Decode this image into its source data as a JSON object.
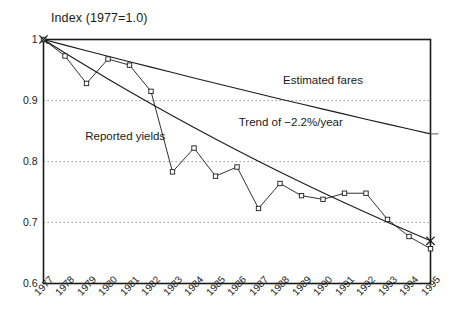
{
  "chart_data": {
    "type": "line",
    "title": "Index (1977=1.0)",
    "xlabel": "",
    "ylabel": "",
    "xlim": [
      1977,
      1995
    ],
    "ylim": [
      0.6,
      1.0
    ],
    "grid": true,
    "gridlines_y": [
      0.9,
      0.8,
      0.7
    ],
    "legend_position": "inline-annotations",
    "categories": [
      1977,
      1978,
      1979,
      1980,
      1981,
      1982,
      1983,
      1984,
      1985,
      1986,
      1987,
      1988,
      1989,
      1990,
      1991,
      1992,
      1993,
      1994,
      1995
    ],
    "xtick_labels": [
      "1977",
      "1978",
      "1979",
      "1980",
      "1981",
      "1982",
      "1983",
      "1984",
      "1985",
      "1986",
      "1987",
      "1988",
      "1989",
      "1990",
      "1991",
      "1992",
      "1993",
      "1994",
      "1995"
    ],
    "ytick_labels": [
      "1",
      "0.9",
      "0.8",
      "0.7",
      "0.6"
    ],
    "ytick_values": [
      1.0,
      0.9,
      0.8,
      0.7,
      0.6
    ],
    "series": [
      {
        "name": "Reported yields",
        "marker": "square",
        "values": [
          1.0,
          0.973,
          0.928,
          0.968,
          0.958,
          0.915,
          0.783,
          0.822,
          0.776,
          0.791,
          0.723,
          0.764,
          0.744,
          0.738,
          0.748,
          0.748,
          0.705,
          0.677,
          0.657
        ]
      },
      {
        "name": "Estimated fares",
        "marker": "none",
        "values": [
          1.0,
          0.9908,
          0.9817,
          0.9726,
          0.9636,
          0.9547,
          0.9458,
          0.937,
          0.9283,
          0.9197,
          0.9111,
          0.9026,
          0.8942,
          0.8859,
          0.8776,
          0.8694,
          0.8613,
          0.8533,
          0.8453
        ]
      },
      {
        "name": "Trend of −2.2%/year",
        "marker": "x-endpoint",
        "values": [
          1.0,
          0.978,
          0.9565,
          0.9354,
          0.9148,
          0.8947,
          0.875,
          0.8558,
          0.8369,
          0.8185,
          0.8005,
          0.7829,
          0.7657,
          0.7488,
          0.7323,
          0.7162,
          0.7005,
          0.6851,
          0.67
        ]
      }
    ],
    "annotations": [
      {
        "text": "Estimated fares",
        "x": 1990.0,
        "y": 0.93
      },
      {
        "text": "Trend of −2.2%/year",
        "x": 1988.5,
        "y": 0.862
      },
      {
        "text": "Reported yields",
        "x": 1980.8,
        "y": 0.838
      }
    ]
  }
}
